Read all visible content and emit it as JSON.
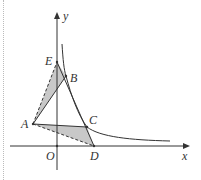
{
  "figure": {
    "axes": {
      "x_label": "x",
      "y_label": "y",
      "origin_label": "O"
    },
    "points": {
      "A": {
        "label": "A",
        "px": [
          33,
          124
        ]
      },
      "B": {
        "label": "B",
        "px": [
          66,
          76
        ]
      },
      "C": {
        "label": "C",
        "px": [
          87,
          127
        ]
      },
      "D": {
        "label": "D",
        "px": [
          94,
          146
        ]
      },
      "E": {
        "label": "E",
        "px": [
          57,
          62
        ]
      }
    },
    "shaded_regions": [
      "triangle AEB",
      "triangle ACD"
    ],
    "dashed_segments": [
      "AE",
      "AD"
    ],
    "solid_segments": [
      "AB",
      "AC",
      "ED"
    ],
    "curve": "hyperbola y = k/x (first quadrant)",
    "colors": {
      "line": "#333333",
      "shade": "#c8c8c8",
      "border": "#bbbbbb"
    }
  }
}
